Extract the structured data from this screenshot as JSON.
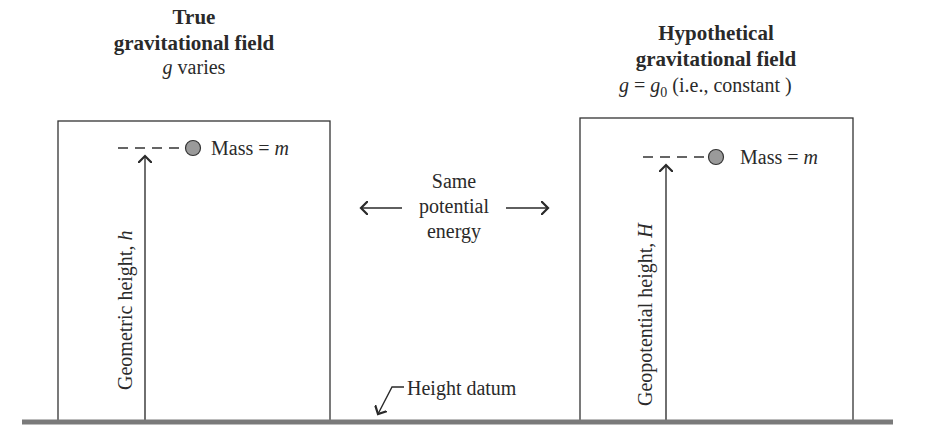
{
  "left_panel": {
    "title_line1": "True",
    "title_line2": "gravitational field",
    "subtitle_var": "g",
    "subtitle_rest": " varies",
    "mass_label": "Mass = ",
    "mass_symbol": "m",
    "axis_label": "Geometric height, ",
    "axis_symbol": "h"
  },
  "right_panel": {
    "title_line1": "Hypothetical",
    "title_line2": "gravitational field",
    "subtitle_var": "g",
    "subtitle_eq": " = ",
    "subtitle_var2": "g",
    "subtitle_sub": "0",
    "subtitle_rest": " (i.e., constant )",
    "mass_label": "Mass = ",
    "mass_symbol": "m",
    "axis_label": "Geopotential height, ",
    "axis_symbol": "H"
  },
  "middle": {
    "line1": "Same",
    "line2": "potential",
    "line3": "energy"
  },
  "datum_label": "Height datum",
  "colors": {
    "line": "#333333",
    "ground": "#7a7a7a",
    "mass_fill": "#9a9a9a"
  }
}
